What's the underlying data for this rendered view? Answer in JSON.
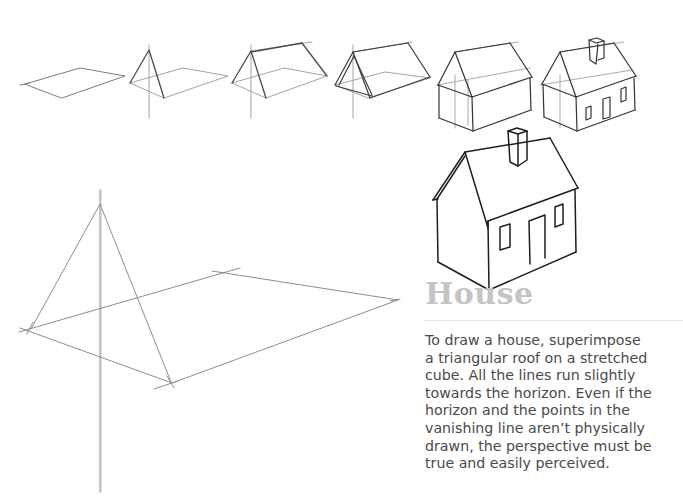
{
  "page": {
    "heading": "House",
    "body_lines": [
      "To draw a house, superimpose",
      "a triangular roof on a stretched",
      "cube. All the lines run slightly",
      "towards the horizon. Even if the",
      "horizon and the points in the",
      "vanishing line aren’t physically",
      "drawn, the perspective must be",
      "true and easily perceived."
    ],
    "colors": {
      "heading": "#c4c4c4",
      "text": "#4a4a4a",
      "construction_line": "#9a9a9a",
      "ink_line": "#2a2a2a",
      "divider": "#e3e3e3"
    }
  },
  "illustrations": {
    "steps": [
      {
        "step": 1,
        "label": "base-parallelogram"
      },
      {
        "step": 2,
        "label": "triangular-gable"
      },
      {
        "step": 3,
        "label": "roof-ridge"
      },
      {
        "step": 4,
        "label": "roof-outline"
      },
      {
        "step": 5,
        "label": "walls-box"
      },
      {
        "step": 6,
        "label": "chimney-door-windows"
      }
    ],
    "final": "finished-house-ink",
    "large_construction": "enlarged-base-and-gable-construction"
  }
}
